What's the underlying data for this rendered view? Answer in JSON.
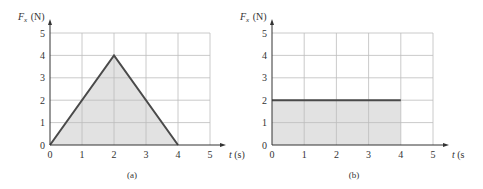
{
  "chart_data": [
    {
      "type": "area",
      "panel": "(a)",
      "title": "",
      "xlabel": "t (s)",
      "ylabel": "F_x (N)",
      "x": [
        0,
        2,
        4
      ],
      "y": [
        0,
        4,
        0
      ],
      "x_ticks": [
        "0",
        "1",
        "2",
        "3",
        "4",
        "5"
      ],
      "y_ticks": [
        "0",
        "1",
        "2",
        "3",
        "4",
        "5"
      ],
      "xlim": [
        0,
        5
      ],
      "ylim": [
        0,
        5
      ],
      "grid": true,
      "fill_under": true
    },
    {
      "type": "area",
      "panel": "(b)",
      "title": "",
      "xlabel": "t (s",
      "ylabel": "F_x (N)",
      "x": [
        0,
        4
      ],
      "y": [
        2,
        2
      ],
      "x_ticks": [
        "0",
        "1",
        "2",
        "3",
        "4",
        "5"
      ],
      "y_ticks": [
        "0",
        "1",
        "2",
        "3",
        "4",
        "5"
      ],
      "xlim": [
        0,
        5
      ],
      "ylim": [
        0,
        5
      ],
      "grid": true,
      "fill_under": true
    }
  ],
  "panels": {
    "a": {
      "caption": "(a)",
      "ylabel_main": "F",
      "ylabel_sub": "x",
      "ylabel_unit": "(N)",
      "xlabel_var": "t",
      "xlabel_unit": "(s)"
    },
    "b": {
      "caption": "(b)",
      "ylabel_main": "F",
      "ylabel_sub": "x",
      "ylabel_unit": "(N)",
      "xlabel_var": "t",
      "xlabel_unit": "(s"
    }
  },
  "colors": {
    "fill": "#e2e2e2",
    "line": "#4a4a4a",
    "grid": "#bdbdbd",
    "axis": "#333333"
  }
}
